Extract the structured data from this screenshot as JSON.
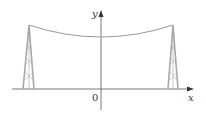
{
  "diagram": {
    "type": "catenary-cable-between-towers",
    "axes": {
      "x_label": "x",
      "y_label": "y",
      "origin_label": "0"
    },
    "colors": {
      "axis": "#555555",
      "cable": "#9a9a9a",
      "tower": "#a8a8a8",
      "label": "#333333"
    },
    "elements": [
      "left-tower",
      "right-tower",
      "hanging-cable",
      "x-axis",
      "y-axis"
    ]
  }
}
